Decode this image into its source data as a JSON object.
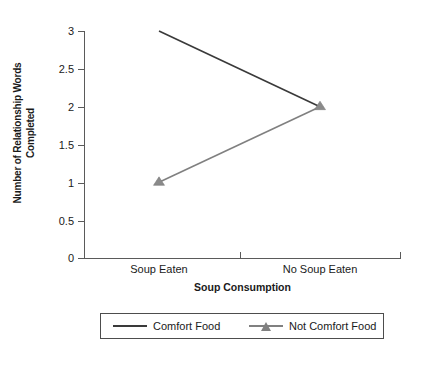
{
  "chart_data": {
    "type": "line",
    "title": "",
    "xlabel": "Soup Consumption",
    "ylabel": "Number of Relationship Words Completed",
    "ylabel_line1": "Number of Relationship Words",
    "ylabel_line2": "Completed",
    "categories": [
      "Soup Eaten",
      "No Soup Eaten"
    ],
    "ylim": [
      0,
      3
    ],
    "yticks": [
      0,
      0.5,
      1,
      1.5,
      2,
      2.5,
      3
    ],
    "ytick_labels": [
      "0",
      "0.5",
      "1",
      "1.5",
      "2",
      "2.5",
      "3"
    ],
    "grid": false,
    "legend_position": "bottom",
    "series": [
      {
        "name": "Comfort Food",
        "values": [
          3,
          2
        ],
        "color": "#3a3a3a",
        "marker": "none"
      },
      {
        "name": "Not Comfort Food",
        "values": [
          1,
          2
        ],
        "color": "#808080",
        "marker": "triangle"
      }
    ]
  },
  "legend": {
    "entries": [
      {
        "label": "Comfort Food"
      },
      {
        "label": "Not Comfort Food"
      }
    ]
  },
  "axes": {
    "x_categories": [
      "Soup Eaten",
      "No Soup Eaten"
    ],
    "y_tick_labels": [
      "3",
      "2.5",
      "2",
      "1.5",
      "1",
      "0.5",
      "0"
    ]
  }
}
